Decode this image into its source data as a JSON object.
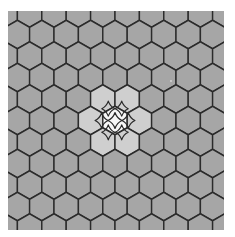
{
  "board": {
    "type": "hex-grid",
    "orientation": "pointy-top",
    "bounds": {
      "x": 8,
      "y": 11,
      "width": 216,
      "height": 219
    },
    "hex_width": 24.4,
    "hex_side": 14.2,
    "row_spacing": 21.5,
    "first_row_center_y": 13,
    "even_row_first_center_x": 5.2,
    "odd_row_first_center_x": 17.4,
    "rows": 11,
    "cols": 10,
    "colors": {
      "background": "#ffffff",
      "cell": "#a6a6a6",
      "cell_neighbor": "#cfcfcf",
      "cell_selected": "#f7f7f7",
      "grid_line": "#2b2b2b",
      "star_stroke": "#2b2b2b"
    },
    "selected_cell": {
      "row": 5,
      "col": 4,
      "icon": "four-point-star-icon"
    },
    "neighbor_cells": [
      {
        "row": 4,
        "col": 4,
        "icon": "four-point-star-icon"
      },
      {
        "row": 4,
        "col": 5,
        "icon": "four-point-star-icon"
      },
      {
        "row": 5,
        "col": 3,
        "icon": "four-point-star-icon"
      },
      {
        "row": 5,
        "col": 5,
        "icon": "four-point-star-icon"
      },
      {
        "row": 6,
        "col": 4,
        "icon": "four-point-star-icon"
      },
      {
        "row": 6,
        "col": 5,
        "icon": "four-point-star-icon"
      }
    ]
  }
}
